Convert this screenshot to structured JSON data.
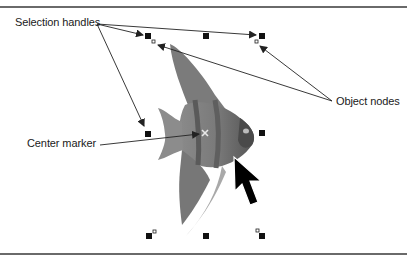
{
  "figure": {
    "labels": {
      "selection_handles": "Selection handles",
      "object_nodes": "Object nodes",
      "center_marker": "Center marker"
    },
    "colors": {
      "handle": "#111111",
      "arrow": "#222222",
      "rule": "#6a6a6a",
      "background": "#ffffff"
    },
    "bounding_box": {
      "x1": 148,
      "y1": 36,
      "x2": 262,
      "y2": 236
    },
    "handles": [
      {
        "pos": "top-left",
        "x": 148,
        "y": 36
      },
      {
        "pos": "top-center",
        "x": 206,
        "y": 36
      },
      {
        "pos": "top-right",
        "x": 262,
        "y": 36
      },
      {
        "pos": "middle-left",
        "x": 148,
        "y": 134
      },
      {
        "pos": "middle-right",
        "x": 262,
        "y": 133
      },
      {
        "pos": "bottom-left",
        "x": 149,
        "y": 236
      },
      {
        "pos": "bottom-center",
        "x": 206,
        "y": 236
      },
      {
        "pos": "bottom-right",
        "x": 262,
        "y": 236
      }
    ],
    "nodes": [
      {
        "x": 153,
        "y": 41
      },
      {
        "x": 256,
        "y": 41
      },
      {
        "x": 154,
        "y": 231
      },
      {
        "x": 257,
        "y": 230
      }
    ],
    "center": {
      "x": 205,
      "y": 133,
      "glyph": "×"
    },
    "cursor_icon": "arrow-pointer-icon"
  }
}
